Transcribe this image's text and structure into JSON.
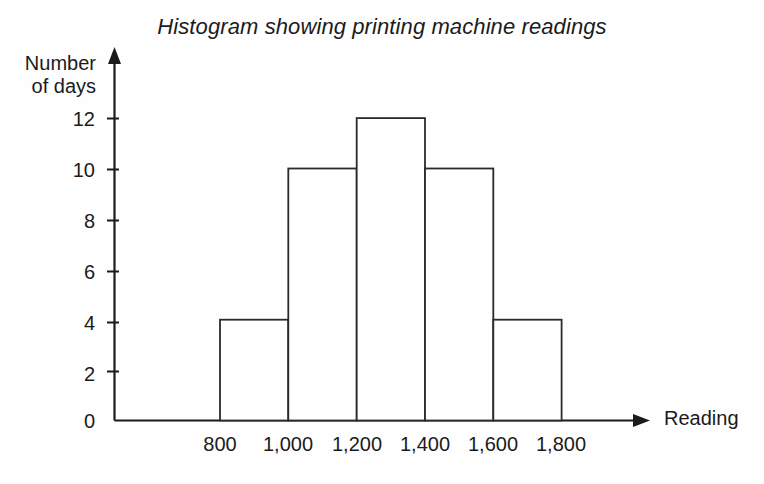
{
  "chart_data": {
    "type": "bar",
    "title": "Histogram showing printing machine readings",
    "xlabel": "Reading",
    "ylabel": "Number of days",
    "ylabel_lines": [
      "Number",
      "of days"
    ],
    "categories": [
      "800-1,000",
      "1,000-1,200",
      "1,200-1,400",
      "1,400-1,600",
      "1,600-1,800"
    ],
    "bin_edges": [
      800,
      1000,
      1200,
      1400,
      1600,
      1800
    ],
    "values": [
      4,
      10,
      12,
      10,
      4
    ],
    "xtick_labels": [
      "800",
      "1,000",
      "1,200",
      "1,400",
      "1,600",
      "1,800"
    ],
    "ytick_labels": [
      "0",
      "2",
      "4",
      "6",
      "8",
      "10",
      "12"
    ],
    "ytick_values": [
      0,
      2,
      4,
      6,
      8,
      10,
      12
    ],
    "ylim": [
      0,
      13
    ],
    "xlim": [
      800,
      1800
    ],
    "grid": false,
    "legend": null,
    "bar_fill": "#ffffff",
    "bar_stroke": "#2b2b2b",
    "axis_color": "#1b1b1b",
    "background": "#fefefe"
  },
  "axis": {
    "y_arrow": "up-arrow-icon",
    "x_arrow": "right-arrow-icon"
  }
}
